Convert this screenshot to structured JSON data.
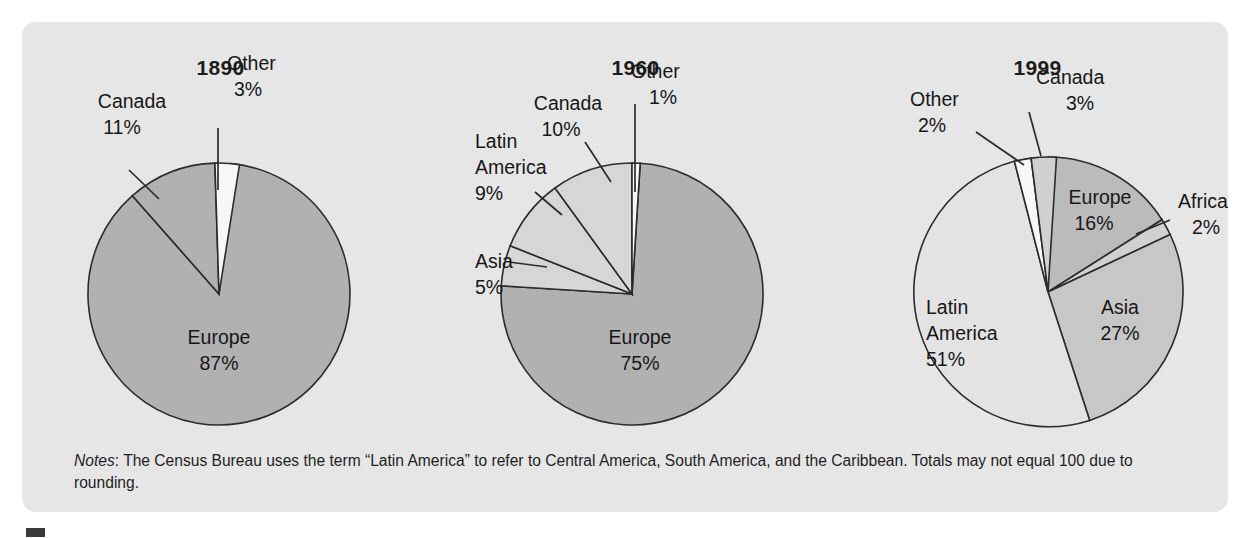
{
  "figure": {
    "background_color": "#e9e9e9",
    "page_color": "#ffffff",
    "marker_color": "#3a3a3a",
    "notes_lead": "Notes",
    "notes_text": ": The Census Bureau uses the term “Latin America” to refer to Central America, South America, and the Caribbean. Totals may not equal 100 due to rounding."
  },
  "chart_data": [
    {
      "type": "pie",
      "title": "1890",
      "labels": [
        "Europe",
        "Canada",
        "Other"
      ],
      "values": [
        87,
        11,
        3
      ],
      "value_labels": [
        "87%",
        "11%",
        "3%"
      ],
      "colors": [
        "#b3b3b3",
        "#b3b3b3",
        "#fafafa"
      ],
      "legend": "none",
      "units": "percent"
    },
    {
      "type": "pie",
      "title": "1960",
      "labels": [
        "Europe",
        "Canada",
        "Latin America",
        "Asia",
        "Other"
      ],
      "values": [
        75,
        10,
        9,
        5,
        1
      ],
      "value_labels": [
        "75%",
        "10%",
        "9%",
        "5%",
        "1%"
      ],
      "colors": [
        "#b3b3b3",
        "#d9d9d9",
        "#d9d9d9",
        "#d9d9d9",
        "#fbfbfb"
      ],
      "legend": "none",
      "units": "percent"
    },
    {
      "type": "pie",
      "title": "1999",
      "labels": [
        "Canada",
        "Europe",
        "Africa",
        "Asia",
        "Latin America",
        "Other"
      ],
      "values": [
        3,
        16,
        2,
        27,
        51,
        2
      ],
      "value_labels": [
        "3%",
        "16%",
        "2%",
        "27%",
        "51%",
        "2%"
      ],
      "colors": [
        "#d3d3d3",
        "#bdbdbd",
        "#d3d3d3",
        "#c9c9c9",
        "#e6e6e6",
        "#fbfbfb"
      ],
      "legend": "none",
      "units": "percent"
    }
  ],
  "charts": [
    {
      "title": "1890",
      "labels": {
        "other_name": "Other",
        "other_pct": "3%",
        "canada_name": "Canada",
        "canada_pct": "11%",
        "europe_name": "Europe",
        "europe_pct": "87%"
      }
    },
    {
      "title": "1960",
      "labels": {
        "other_name": "Other",
        "other_pct": "1%",
        "canada_name": "Canada",
        "canada_pct": "10%",
        "latin_name_1": "Latin",
        "latin_name_2": "America",
        "latin_pct": "9%",
        "asia_name": "Asia",
        "asia_pct": "5%",
        "europe_name": "Europe",
        "europe_pct": "75%"
      }
    },
    {
      "title": "1999",
      "labels": {
        "canada_name": "Canada",
        "canada_pct": "3%",
        "other_name": "Other",
        "other_pct": "2%",
        "europe_name": "Europe",
        "europe_pct": "16%",
        "africa_name": "Africa",
        "africa_pct": "2%",
        "asia_name": "Asia",
        "asia_pct": "27%",
        "latin_name_1": "Latin",
        "latin_name_2": "America",
        "latin_pct": "51%"
      }
    }
  ]
}
